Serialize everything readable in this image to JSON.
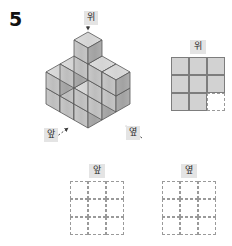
{
  "problem": {
    "number": "5"
  },
  "figure": {
    "type": "isometric-cube-stack",
    "direction_labels": {
      "top": "위",
      "front": "앞",
      "side": "옆"
    },
    "arrows": {
      "top": "arrow-down",
      "front": "arrow-up-right",
      "side": "arrow-up-left"
    },
    "colors": {
      "face_top": "#d9d9d9",
      "face_left": "#c2c2c2",
      "face_right": "#a8a8a8",
      "outline": "#555555"
    },
    "layers": {
      "bottom": [
        [
          1,
          1,
          1
        ],
        [
          1,
          1,
          1
        ],
        [
          1,
          1,
          0
        ]
      ],
      "middle": [
        [
          1,
          1,
          1
        ],
        [
          1,
          0,
          1
        ],
        [
          0,
          0,
          0
        ]
      ],
      "top": [
        [
          1,
          0,
          0
        ],
        [
          0,
          0,
          0
        ],
        [
          0,
          0,
          0
        ]
      ]
    }
  },
  "views": {
    "top": {
      "label": "위",
      "rows": 3,
      "cols": 3,
      "cells": [
        [
          "filled",
          "filled",
          "filled"
        ],
        [
          "filled",
          "filled",
          "filled"
        ],
        [
          "filled",
          "filled",
          "dashed"
        ]
      ]
    },
    "front": {
      "label": "앞",
      "rows": 3,
      "cols": 3,
      "cells": [
        [
          "dashed",
          "dashed",
          "dashed"
        ],
        [
          "dashed",
          "dashed",
          "dashed"
        ],
        [
          "dashed",
          "dashed",
          "dashed"
        ]
      ]
    },
    "side": {
      "label": "옆",
      "rows": 3,
      "cols": 3,
      "cells": [
        [
          "dashed",
          "dashed",
          "dashed"
        ],
        [
          "dashed",
          "dashed",
          "dashed"
        ],
        [
          "dashed",
          "dashed",
          "dashed"
        ]
      ]
    }
  }
}
